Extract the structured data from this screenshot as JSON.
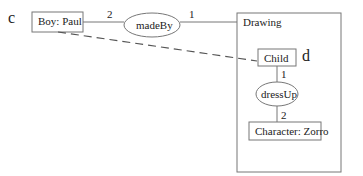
{
  "labels": {
    "c": "c",
    "d": "d",
    "boy": "Boy: Paul",
    "madeBy": "madeBy",
    "drawing": "Drawing",
    "child": "Child",
    "dressUp": "dressUp",
    "character": "Character: Zorro",
    "mult_boy_madeBy": "2",
    "mult_madeBy_drawing": "1",
    "mult_child_dressUp": "1",
    "mult_dressUp_character": "2"
  }
}
